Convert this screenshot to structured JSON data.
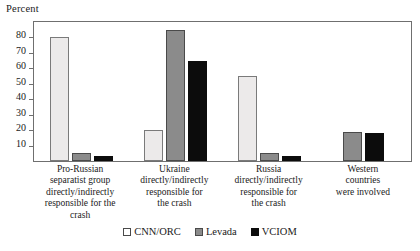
{
  "chart_data": {
    "type": "bar",
    "title": "",
    "subtitle": "",
    "ylabel": "Percent",
    "xlabel": "",
    "ylim": [
      0,
      90
    ],
    "yticks": [
      10,
      20,
      30,
      40,
      50,
      60,
      70,
      80
    ],
    "grid": false,
    "legend_position": "bottom",
    "categories": [
      "Pro-Russian separatist group directly/indirectly responsible for the crash",
      "Ukraine directly/indirectly responsible for the crash",
      "Russia directly/indirectly responsible for the crash",
      "Western countries were involved"
    ],
    "category_lines": [
      [
        "Pro-Russian",
        "separatist group",
        "directly/indirectly",
        "responsible for the crash"
      ],
      [
        "Ukraine",
        "directly/indirectly",
        "responsible for",
        "the crash"
      ],
      [
        "Russia",
        "directly/indirectly",
        "responsible for",
        "the crash"
      ],
      [
        "Western",
        "countries",
        "were involved"
      ]
    ],
    "series": [
      {
        "name": "CNN/ORC",
        "color": "#eceaea",
        "values": [
          80,
          20,
          55,
          null
        ]
      },
      {
        "name": "Levada",
        "color": "#8b8b8b",
        "values": [
          5,
          85,
          5,
          19
        ]
      },
      {
        "name": "VCIOM",
        "color": "#0c0c0c",
        "values": [
          3,
          65,
          3,
          18
        ]
      }
    ]
  },
  "legend": {
    "items": [
      {
        "label": "CNN/ORC"
      },
      {
        "label": "Levada"
      },
      {
        "label": "VCIOM"
      }
    ]
  },
  "axis": {
    "y_caption": "Percent",
    "tick_80": "80",
    "tick_70": "70",
    "tick_60": "60",
    "tick_50": "50",
    "tick_40": "40",
    "tick_30": "30",
    "tick_20": "20",
    "tick_10": "10"
  }
}
